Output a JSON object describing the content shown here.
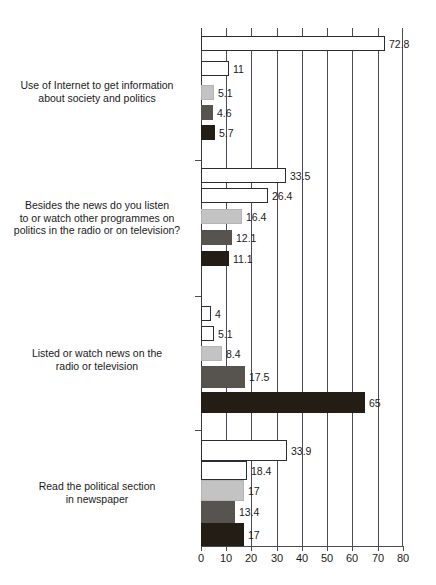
{
  "chart_data": {
    "type": "bar",
    "orientation": "horizontal",
    "title": "",
    "xlabel": "",
    "ylabel": "",
    "xlim": [
      0,
      80
    ],
    "xticks": [
      0,
      10,
      20,
      30,
      40,
      50,
      60,
      70,
      80
    ],
    "xtick_labels": [
      "0",
      "10",
      "20",
      "30",
      "40",
      "50",
      "60",
      "70",
      "80"
    ],
    "grid": true,
    "grid_axis": "x",
    "legend": false,
    "legend_position": "none",
    "categories": [
      "Use of Internet to get information about society and politics",
      "Besides the news do you listen to or watch other programmes on politics in the radio or on television?",
      "Listed or watch news on the radio or television",
      "Read the political section in newspaper"
    ],
    "series": [
      {
        "name": "series-1",
        "color": "#ffffff",
        "values": [
          72.8,
          33.5,
          4,
          33.9
        ]
      },
      {
        "name": "series-2",
        "color": "#ffffff",
        "values": [
          11,
          26.4,
          5.1,
          18.4
        ]
      },
      {
        "name": "series-3",
        "color": "#c3c3c3",
        "values": [
          5.1,
          16.4,
          8.4,
          17
        ]
      },
      {
        "name": "series-4",
        "color": "#57544f",
        "values": [
          4.6,
          12.1,
          17.5,
          13.4
        ]
      },
      {
        "name": "series-5",
        "color": "#241d15",
        "values": [
          5.7,
          11.1,
          65,
          17
        ]
      }
    ],
    "groups": [
      {
        "label_lines": [
          "Use of Internet to get information",
          "about society and politics"
        ],
        "bars": [
          {
            "value": 72.8,
            "label": "72.8",
            "style": "s0"
          },
          {
            "value": 11,
            "label": "11",
            "style": "s1"
          },
          {
            "value": 5.1,
            "label": "5.1",
            "style": "s2"
          },
          {
            "value": 4.6,
            "label": "4.6",
            "style": "s3"
          },
          {
            "value": 5.7,
            "label": "5.7",
            "style": "s4"
          }
        ]
      },
      {
        "label_lines": [
          "Besides the news do you listen",
          "to or watch other programmes on",
          "politics in the radio or on television?"
        ],
        "bars": [
          {
            "value": 33.5,
            "label": "33.5",
            "style": "s0"
          },
          {
            "value": 26.4,
            "label": "26.4",
            "style": "s1"
          },
          {
            "value": 16.4,
            "label": "16.4",
            "style": "s2"
          },
          {
            "value": 12.1,
            "label": "12.1",
            "style": "s3"
          },
          {
            "value": 11.1,
            "label": "11.1",
            "style": "s4"
          }
        ]
      },
      {
        "label_lines": [
          "Listed or watch news on the",
          "radio or television"
        ],
        "bars": [
          {
            "value": 4,
            "label": "4",
            "style": "s0"
          },
          {
            "value": 5.1,
            "label": "5.1",
            "style": "s1"
          },
          {
            "value": 8.4,
            "label": "8.4",
            "style": "s2"
          },
          {
            "value": 17.5,
            "label": "17.5",
            "style": "s3"
          },
          {
            "value": 65,
            "label": "65",
            "style": "s4"
          }
        ]
      },
      {
        "label_lines": [
          "Read the political section",
          "in newspaper"
        ],
        "bars": [
          {
            "value": 33.9,
            "label": "33.9",
            "style": "s0"
          },
          {
            "value": 18.4,
            "label": "18.4",
            "style": "s1"
          },
          {
            "value": 17,
            "label": "17",
            "style": "s2"
          },
          {
            "value": 13.4,
            "label": "13.4",
            "style": "s3"
          },
          {
            "value": 17,
            "label": "17",
            "style": "s4"
          }
        ]
      }
    ]
  },
  "layout": {
    "plot_left_px": 201,
    "plot_width_px": 202,
    "plot_top_px": 28,
    "axis_y_px": 546,
    "group_tops_px": [
      36,
      168,
      306,
      440
    ],
    "bar_height_px": 15,
    "bar_gap_px": 0,
    "group_sep_ticks_px": [
      160,
      296,
      430
    ]
  }
}
